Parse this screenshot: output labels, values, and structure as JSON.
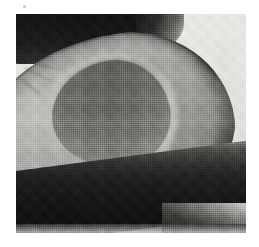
{
  "figure": {
    "type": "photograph",
    "medium": "halftone-printed grayscale photograph",
    "orientation": "horizontal, narrow stem end pointing to lower right",
    "caption": ""
  },
  "page": {
    "background_color": "#ffffff",
    "margin_top_px": 14,
    "margin_left_px": 16,
    "margin_right_px": 13,
    "margin_bottom_px": 14
  },
  "plate": {
    "left_px": 16,
    "top_px": 14,
    "width_px": 230,
    "height_px": 219,
    "border": "none"
  },
  "regions": {
    "background_upper_right": {
      "name": "light studio backdrop",
      "color": "#efefed"
    },
    "shadow_top": {
      "name": "dark shadow band across upper left",
      "color": "#101010"
    },
    "shadow_bottom": {
      "name": "dark cast shadow under the fruit",
      "color": "#0c0c0c"
    },
    "flesh": {
      "name": "avocado flesh cut surface",
      "color": "#a8a8a6",
      "highlight_color": "#c8c8c5"
    },
    "skin_rim": {
      "name": "dark outer skin edge",
      "color": "#2e2e2c"
    },
    "pit_cavity": {
      "name": "hollow left by the removed pit",
      "color": "#7d7d7b",
      "rim_color": "#c6c6c3"
    },
    "stem_nub": {
      "name": "small stem-end nub protruding at lower right",
      "color": "#5a5a58"
    },
    "print_speck": {
      "name": "stray ink speck in the page margin",
      "color": "#bdbdbb"
    }
  },
  "texture": {
    "name": "halftone dot screen",
    "dot_pitch_px": 2.1,
    "visible": true
  },
  "palette": {
    "paper_white": "#ffffff",
    "backdrop_light": "#efefed",
    "flesh_mid": "#a8a8a6",
    "flesh_highlight": "#c8c8c5",
    "cavity_dark": "#7d7d7b",
    "skin_dark": "#2e2e2c",
    "shadow_black": "#0b0b0b"
  }
}
